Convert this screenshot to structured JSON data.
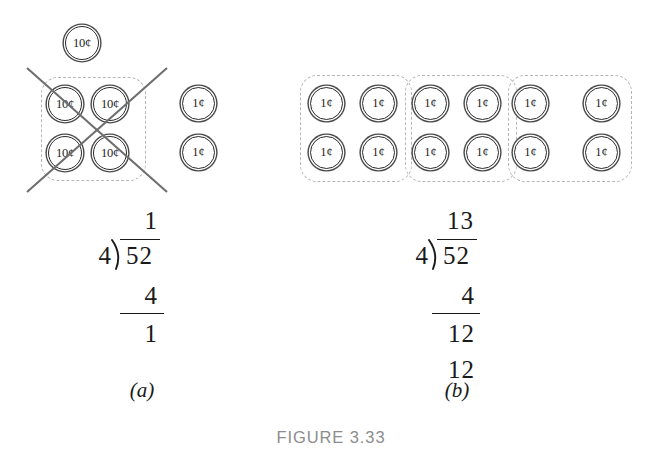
{
  "figure": {
    "caption": "FIGURE 3.33",
    "panels": [
      {
        "id": "a",
        "label": "(a)"
      },
      {
        "id": "b",
        "label": "(b)"
      }
    ]
  },
  "coin_labels": {
    "dime": "10¢",
    "penny": "1¢"
  },
  "panel_a": {
    "leftover_dime": {
      "label": "10¢"
    },
    "dime_group": {
      "crossed_out": true,
      "coins": [
        {
          "label": "10¢"
        },
        {
          "label": "10¢"
        },
        {
          "label": "10¢"
        },
        {
          "label": "10¢"
        }
      ]
    },
    "loose_pennies": [
      {
        "label": "1¢"
      },
      {
        "label": "1¢"
      }
    ],
    "division": {
      "quotient": "1",
      "divisor": "4",
      "dividend": "52",
      "steps": [
        "4"
      ],
      "remainder": "1"
    }
  },
  "panel_b": {
    "penny_groups": [
      {
        "coins": [
          {
            "label": "1¢"
          },
          {
            "label": "1¢"
          },
          {
            "label": "1¢"
          },
          {
            "label": "1¢"
          }
        ]
      },
      {
        "coins": [
          {
            "label": "1¢"
          },
          {
            "label": "1¢"
          },
          {
            "label": "1¢"
          },
          {
            "label": "1¢"
          }
        ]
      },
      {
        "coins": [
          {
            "label": "1¢"
          },
          {
            "label": "1¢"
          },
          {
            "label": "1¢"
          },
          {
            "label": "1¢"
          }
        ]
      }
    ],
    "division": {
      "quotient": "13",
      "divisor": "4",
      "dividend": "52",
      "steps": [
        "4",
        "12",
        "12"
      ]
    }
  },
  "colors": {
    "ink": "#1a1a1a",
    "coin_outline": "#2b2b2b",
    "dashed_group": "#b6b6b6",
    "cross_out": "#6e6e6e",
    "caption": "#8c8c8c"
  }
}
